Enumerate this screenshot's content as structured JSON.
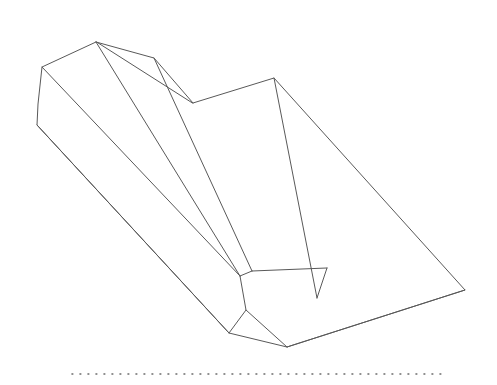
{
  "figure": {
    "kind": "technical-line-sketch",
    "projection": "isometric",
    "background_color": "#ffffff",
    "stroke_color": "#595959",
    "stroke_width": 1,
    "face_fill": "#ffffff",
    "canvas": {
      "width": 497,
      "height": 385
    },
    "baseline": {
      "name": "ground-reference-dotted-line",
      "style": "dotted",
      "color": "#6b6b6b",
      "y": 374,
      "x_start": 72,
      "x_end": 445,
      "dot_spacing": 8,
      "dot_size": 1.6
    },
    "vertices": {
      "apex_top": [
        96,
        42
      ],
      "left_upper": [
        42,
        67
      ],
      "left_lower": [
        37,
        125
      ],
      "ridge_bend": [
        154,
        58
      ],
      "notch_valley": [
        193,
        103
      ],
      "notch_peak": [
        274,
        78
      ],
      "right_point": [
        465,
        290
      ],
      "body_mid_front": [
        240,
        276
      ],
      "body_low_front": [
        246,
        310
      ],
      "body_bottom_left": [
        229,
        333
      ],
      "body_bottom_right": [
        287,
        347
      ],
      "inner_tab_tip": [
        252,
        271
      ],
      "inner_tab_right": [
        327,
        268
      ],
      "inner_tab_bottom": [
        317,
        298
      ]
    },
    "paths": {
      "outer_silhouette": "M 96 42 L 42 67 L 38 104 L 37 125 L 229 333 L 287 347 L 465 290 L 274 78 L 193 103 Z",
      "top_ridge_long": "M 96 42 L 154 58 L 193 103",
      "ridge_to_apex_front": "M 96 42 L 240 276",
      "left_face_edge": "M 42 67 L 240 276",
      "left_lower_to_front": "M 37 125 L 229 333",
      "notch_inner_edge": "M 274 78 L 317 298",
      "ridge_mid_edge": "M 154 58 L 252 271",
      "front_facet_a": "M 240 276 L 246 310 L 229 333",
      "front_facet_b": "M 246 310 L 287 347",
      "front_facet_c": "M 240 276 L 252 271",
      "inner_tab_outline": "M 252 271 L 327 268 L 317 298 L 246 310",
      "inner_tab_upper": "M 252 271 L 327 268",
      "inner_tab_side": "M 327 268 L 317 298",
      "bottom_sweep": "M 287 347 L 465 290"
    },
    "faces": {
      "top_face": "M 96 42 L 154 58 L 193 103 L 274 78 L 327 268 L 252 271 L 240 276 Z",
      "left_face": "M 96 42 L 42 67 L 38 104 L 37 125 L 229 333 L 246 310 L 240 276 Z",
      "right_face": "M 274 78 L 465 290 L 287 347 L 246 310 L 317 298 Z"
    },
    "annotations": {
      "element_count_label": "1 solid",
      "line_count_label": "14 edges"
    }
  }
}
